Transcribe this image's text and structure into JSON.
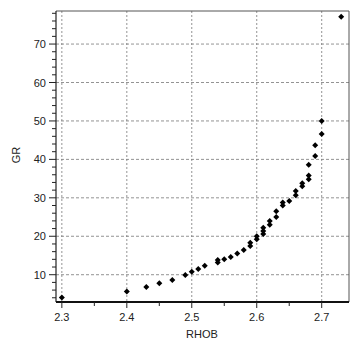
{
  "chart_data": {
    "type": "scatter",
    "title": "",
    "xlabel": "RHOB",
    "ylabel": "GR",
    "xlim": [
      2.291,
      2.742
    ],
    "ylim": [
      2.9,
      78.6
    ],
    "grid": true,
    "grid_style": "dashed",
    "legend": null,
    "marker": "diamond",
    "marker_color": "#000000",
    "x_ticks": [
      2.3,
      2.4,
      2.5,
      2.6,
      2.7
    ],
    "x_tick_labels": [
      "2.3",
      "2.4",
      "2.5",
      "2.6",
      "2.7"
    ],
    "x_minor_ticks": [
      2.35,
      2.45,
      2.55,
      2.65
    ],
    "y_ticks": [
      10,
      20,
      30,
      40,
      50,
      60,
      70
    ],
    "y_tick_labels": [
      "10",
      "20",
      "30",
      "40",
      "50",
      "60",
      "70"
    ],
    "y_minor_step": 2,
    "series": [
      {
        "name": "GR vs RHOB",
        "points": [
          [
            2.3,
            4.1
          ],
          [
            2.4,
            5.6
          ],
          [
            2.43,
            6.8
          ],
          [
            2.45,
            7.8
          ],
          [
            2.47,
            8.6
          ],
          [
            2.49,
            9.9
          ],
          [
            2.5,
            10.8
          ],
          [
            2.51,
            11.5
          ],
          [
            2.52,
            12.3
          ],
          [
            2.54,
            13.2
          ],
          [
            2.54,
            13.8
          ],
          [
            2.55,
            14.0
          ],
          [
            2.56,
            14.6
          ],
          [
            2.57,
            15.5
          ],
          [
            2.58,
            16.4
          ],
          [
            2.59,
            17.5
          ],
          [
            2.59,
            18.3
          ],
          [
            2.6,
            19.2
          ],
          [
            2.6,
            20.0
          ],
          [
            2.61,
            20.6
          ],
          [
            2.61,
            21.4
          ],
          [
            2.61,
            22.2
          ],
          [
            2.62,
            23.0
          ],
          [
            2.62,
            24.0
          ],
          [
            2.63,
            25.0
          ],
          [
            2.63,
            26.5
          ],
          [
            2.64,
            28.0
          ],
          [
            2.64,
            28.8
          ],
          [
            2.65,
            29.2
          ],
          [
            2.66,
            30.7
          ],
          [
            2.66,
            31.8
          ],
          [
            2.67,
            33.0
          ],
          [
            2.67,
            33.8
          ],
          [
            2.68,
            34.8
          ],
          [
            2.68,
            35.8
          ],
          [
            2.68,
            38.6
          ],
          [
            2.69,
            40.9
          ],
          [
            2.69,
            43.7
          ],
          [
            2.7,
            46.6
          ],
          [
            2.7,
            50.0
          ],
          [
            2.73,
            77.1
          ]
        ]
      }
    ]
  }
}
